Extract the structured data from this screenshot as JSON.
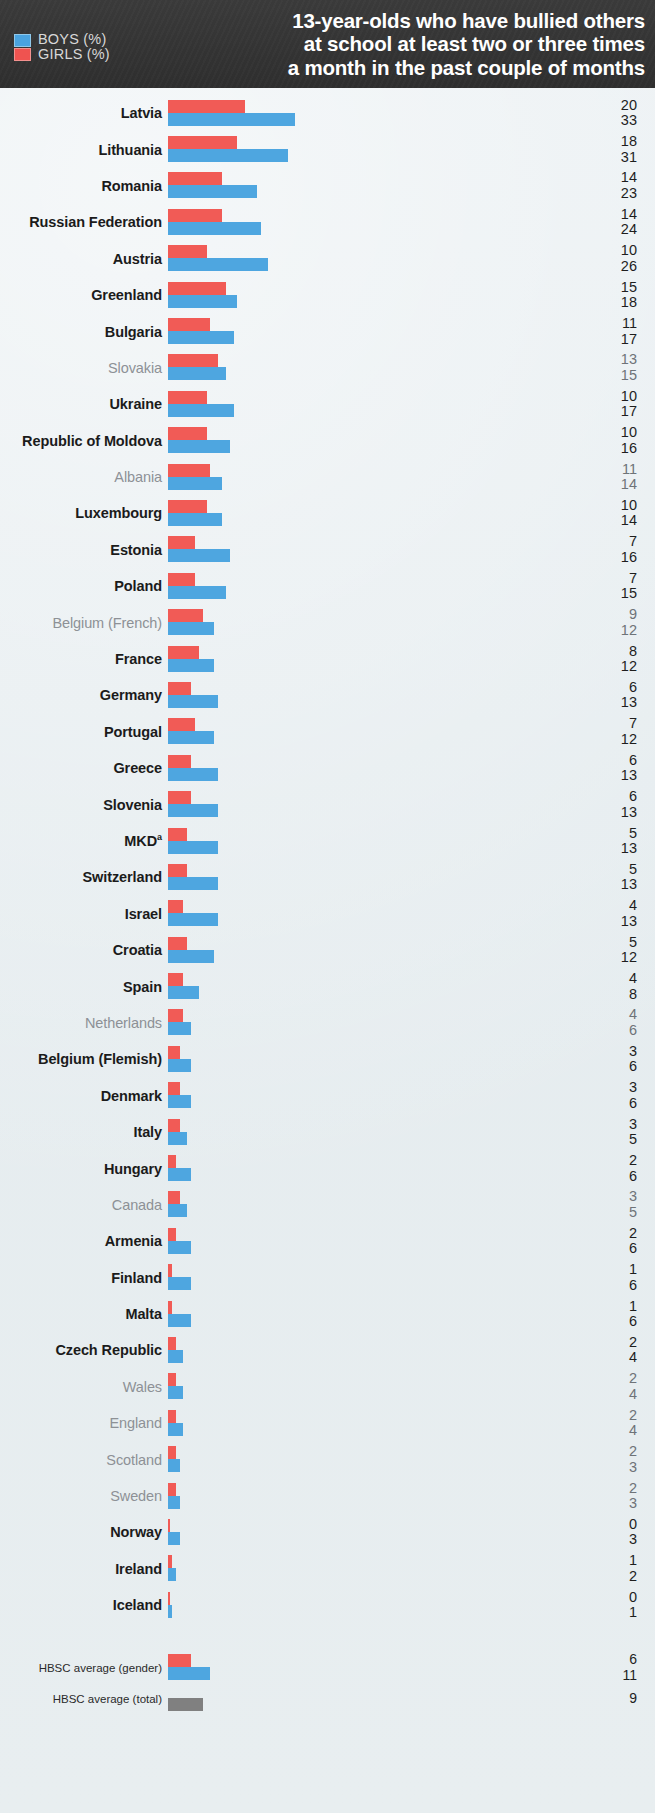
{
  "header": {
    "legend": [
      {
        "key": "boys",
        "label": "BOYS (%)",
        "color": "#4aa3df"
      },
      {
        "key": "girls",
        "label": "GIRLS (%)",
        "color": "#ef5350"
      }
    ],
    "title_lines": [
      "13-year-olds who have bullied others",
      "at school at least two or three times",
      "a month in the past couple of months"
    ],
    "background": "#343434"
  },
  "chart_data": {
    "type": "bar",
    "orientation": "horizontal",
    "title": "13-year-olds who have bullied others at school at least two or three times a month in the past couple of months",
    "xlabel": "",
    "ylabel": "",
    "xlim": [
      0,
      35
    ],
    "grid": false,
    "legend_position": "top-left",
    "value_suffix": "%",
    "colors": {
      "boys": "#4ea6e0",
      "girls": "#f15b56",
      "total": "#808080"
    },
    "categories": [
      "Latvia",
      "Lithuania",
      "Romania",
      "Russian Federation",
      "Austria",
      "Greenland",
      "Bulgaria",
      "Slovakia",
      "Ukraine",
      "Republic of Moldova",
      "Albania",
      "Luxembourg",
      "Estonia",
      "Poland",
      "Belgium (French)",
      "France",
      "Germany",
      "Portugal",
      "Greece",
      "Slovenia",
      "MKD",
      "Switzerland",
      "Israel",
      "Croatia",
      "Spain",
      "Netherlands",
      "Belgium (Flemish)",
      "Denmark",
      "Italy",
      "Hungary",
      "Canada",
      "Armenia",
      "Finland",
      "Malta",
      "Czech Republic",
      "Wales",
      "England",
      "Scotland",
      "Sweden",
      "Norway",
      "Ireland",
      "Iceland"
    ],
    "series": [
      {
        "name": "GIRLS (%)",
        "color": "#f15b56",
        "values": [
          20,
          18,
          14,
          14,
          10,
          15,
          11,
          13,
          10,
          10,
          11,
          10,
          7,
          7,
          9,
          8,
          6,
          7,
          6,
          6,
          5,
          5,
          4,
          5,
          4,
          4,
          3,
          3,
          3,
          2,
          3,
          2,
          1,
          1,
          2,
          2,
          2,
          2,
          2,
          0,
          1,
          0
        ]
      },
      {
        "name": "BOYS (%)",
        "color": "#4ea6e0",
        "values": [
          33,
          31,
          23,
          24,
          26,
          18,
          17,
          15,
          17,
          16,
          14,
          14,
          16,
          15,
          12,
          12,
          13,
          12,
          13,
          13,
          13,
          13,
          13,
          12,
          8,
          6,
          6,
          6,
          5,
          6,
          5,
          6,
          6,
          6,
          4,
          4,
          4,
          3,
          3,
          3,
          2,
          1
        ]
      }
    ],
    "averages": [
      {
        "label": "HBSC average (gender)",
        "girls": 6,
        "boys": 11
      },
      {
        "label": "HBSC average (total)",
        "total": 9
      }
    ]
  },
  "rows": [
    {
      "name": "Latvia",
      "style": "strong",
      "girls": 20,
      "boys": 33
    },
    {
      "name": "Lithuania",
      "style": "strong",
      "girls": 18,
      "boys": 31
    },
    {
      "name": "Romania",
      "style": "strong",
      "girls": 14,
      "boys": 23
    },
    {
      "name": "Russian Federation",
      "style": "strong",
      "girls": 14,
      "boys": 24
    },
    {
      "name": "Austria",
      "style": "strong",
      "girls": 10,
      "boys": 26
    },
    {
      "name": "Greenland",
      "style": "strong",
      "girls": 15,
      "boys": 18
    },
    {
      "name": "Bulgaria",
      "style": "strong",
      "girls": 11,
      "boys": 17
    },
    {
      "name": "Slovakia",
      "style": "muted",
      "girls": 13,
      "boys": 15
    },
    {
      "name": "Ukraine",
      "style": "strong",
      "girls": 10,
      "boys": 17
    },
    {
      "name": "Republic of Moldova",
      "style": "strong",
      "girls": 10,
      "boys": 16
    },
    {
      "name": "Albania",
      "style": "muted",
      "girls": 11,
      "boys": 14
    },
    {
      "name": "Luxembourg",
      "style": "strong",
      "girls": 10,
      "boys": 14
    },
    {
      "name": "Estonia",
      "style": "strong",
      "girls": 7,
      "boys": 16
    },
    {
      "name": "Poland",
      "style": "strong",
      "girls": 7,
      "boys": 15
    },
    {
      "name": "Belgium (French)",
      "style": "muted",
      "girls": 9,
      "boys": 12
    },
    {
      "name": "France",
      "style": "strong",
      "girls": 8,
      "boys": 12
    },
    {
      "name": "Germany",
      "style": "strong",
      "girls": 6,
      "boys": 13
    },
    {
      "name": "Portugal",
      "style": "strong",
      "girls": 7,
      "boys": 12
    },
    {
      "name": "Greece",
      "style": "strong",
      "girls": 6,
      "boys": 13
    },
    {
      "name": "Slovenia",
      "style": "strong",
      "girls": 6,
      "boys": 13
    },
    {
      "name": "MKD",
      "style": "strong",
      "girls": 5,
      "boys": 13,
      "footnote": "a"
    },
    {
      "name": "Switzerland",
      "style": "strong",
      "girls": 5,
      "boys": 13
    },
    {
      "name": "Israel",
      "style": "strong",
      "girls": 4,
      "boys": 13
    },
    {
      "name": "Croatia",
      "style": "strong",
      "girls": 5,
      "boys": 12
    },
    {
      "name": "Spain",
      "style": "strong",
      "girls": 4,
      "boys": 8
    },
    {
      "name": "Netherlands",
      "style": "muted",
      "girls": 4,
      "boys": 6
    },
    {
      "name": "Belgium (Flemish)",
      "style": "strong",
      "girls": 3,
      "boys": 6
    },
    {
      "name": "Denmark",
      "style": "strong",
      "girls": 3,
      "boys": 6
    },
    {
      "name": "Italy",
      "style": "strong",
      "girls": 3,
      "boys": 5
    },
    {
      "name": "Hungary",
      "style": "strong",
      "girls": 2,
      "boys": 6
    },
    {
      "name": "Canada",
      "style": "muted",
      "girls": 3,
      "boys": 5
    },
    {
      "name": "Armenia",
      "style": "strong",
      "girls": 2,
      "boys": 6
    },
    {
      "name": "Finland",
      "style": "strong",
      "girls": 1,
      "boys": 6
    },
    {
      "name": "Malta",
      "style": "strong",
      "girls": 1,
      "boys": 6
    },
    {
      "name": "Czech Republic",
      "style": "strong",
      "girls": 2,
      "boys": 4
    },
    {
      "name": "Wales",
      "style": "muted",
      "girls": 2,
      "boys": 4
    },
    {
      "name": "England",
      "style": "muted",
      "girls": 2,
      "boys": 4
    },
    {
      "name": "Scotland",
      "style": "muted",
      "girls": 2,
      "boys": 3
    },
    {
      "name": "Sweden",
      "style": "muted",
      "girls": 2,
      "boys": 3
    },
    {
      "name": "Norway",
      "style": "strong",
      "girls": 0,
      "boys": 3
    },
    {
      "name": "Ireland",
      "style": "strong",
      "girls": 1,
      "boys": 2
    },
    {
      "name": "Iceland",
      "style": "strong",
      "girls": 0,
      "boys": 1
    }
  ],
  "averages": [
    {
      "name": "HBSC average (gender)",
      "girls": 6,
      "boys": 11
    },
    {
      "name": "HBSC average (total)",
      "total": 9
    }
  ],
  "scale": {
    "px_per_unit": 3.86
  }
}
